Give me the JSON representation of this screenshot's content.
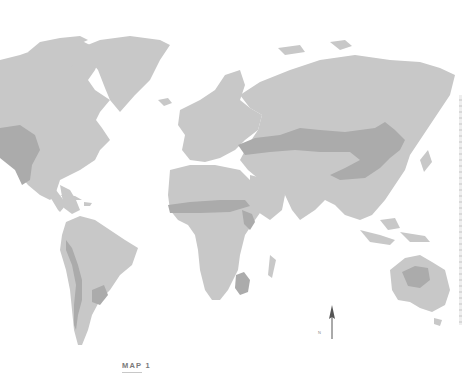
{
  "map": {
    "title_label": "MAP 1",
    "north_label": "N",
    "colors": {
      "background": "#ffffff",
      "land": "#c8c8c8",
      "highlighted_zone": "#ababab",
      "label_text": "#7a7a7a"
    },
    "legend": {
      "land": "land-mass",
      "highlighted_zone": "highlighted-region"
    },
    "highlighted_regions": [
      "North American Great Plains",
      "Eurasian Steppe",
      "Sahel",
      "East Africa",
      "Southern Africa",
      "Pampas",
      "Andes",
      "Central Australia"
    ],
    "icons": {
      "north_arrow": "north-arrow-icon"
    }
  }
}
